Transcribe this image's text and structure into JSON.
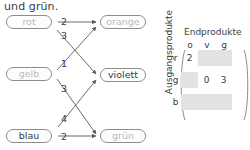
{
  "caption": {
    "text": "und grün."
  },
  "graph": {
    "sources": [
      {
        "id": "rot",
        "label": "rot",
        "style": "dim"
      },
      {
        "id": "gelb",
        "label": "gelb",
        "style": "dim"
      },
      {
        "id": "blau",
        "label": "blau",
        "style": "dark"
      }
    ],
    "targets": [
      {
        "id": "orange",
        "label": "orange",
        "style": "dim"
      },
      {
        "id": "violett",
        "label": "violett",
        "style": "dark"
      },
      {
        "id": "gruen",
        "label": "grün",
        "style": "dim"
      }
    ],
    "edges": [
      {
        "from": "rot",
        "to": "orange",
        "weight": "2"
      },
      {
        "from": "rot",
        "to": "violett",
        "weight": "3"
      },
      {
        "from": "gelb",
        "to": "orange",
        "weight": "1"
      },
      {
        "from": "gelb",
        "to": "gruen",
        "weight": "3"
      },
      {
        "from": "blau",
        "to": "violett",
        "weight": "4"
      },
      {
        "from": "blau",
        "to": "gruen",
        "weight": "2"
      }
    ]
  },
  "matrix": {
    "side_label": "Ausgangsprodukte",
    "title": "Endprodukte",
    "col_headers": [
      "o",
      "v",
      "g"
    ],
    "row_headers": [
      "r",
      "g",
      "b"
    ],
    "cells": [
      [
        "2",
        "",
        ""
      ],
      [
        "",
        "0",
        "3"
      ],
      [
        "",
        "",
        ""
      ]
    ]
  },
  "colors": {
    "ink": "#3c3c3c",
    "dim_ink": "#b9b9b9",
    "node_border": "#8c8c8c",
    "blank_cell": "#e2e2e2",
    "edge": "#5a5a5a"
  }
}
